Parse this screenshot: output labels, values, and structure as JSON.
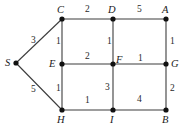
{
  "figure": {
    "kind": "weighted-undirected-graph",
    "width": 182,
    "height": 128,
    "background": "#ffffff",
    "edge_color": "#3d3d3d",
    "node_color": "#111111",
    "label_color": "#1a1a1a"
  },
  "nodes": [
    {
      "id": "S",
      "label": "S",
      "x": 16,
      "y": 63,
      "label_x": 5,
      "label_y": 58
    },
    {
      "id": "C",
      "label": "C",
      "x": 62,
      "y": 19,
      "label_x": 57,
      "label_y": 5
    },
    {
      "id": "D",
      "label": "D",
      "x": 113,
      "y": 19,
      "label_x": 108,
      "label_y": 5
    },
    {
      "id": "A",
      "label": "A",
      "x": 166,
      "y": 19,
      "label_x": 162,
      "label_y": 5
    },
    {
      "id": "E",
      "label": "E",
      "x": 62,
      "y": 64,
      "label_x": 49,
      "label_y": 59
    },
    {
      "id": "F",
      "label": "F",
      "x": 113,
      "y": 64,
      "label_x": 116,
      "label_y": 55
    },
    {
      "id": "G",
      "label": "G",
      "x": 166,
      "y": 64,
      "label_x": 171,
      "label_y": 59
    },
    {
      "id": "H",
      "label": "H",
      "x": 62,
      "y": 110,
      "label_x": 57,
      "label_y": 115
    },
    {
      "id": "I",
      "label": "I",
      "x": 113,
      "y": 110,
      "label_x": 110,
      "label_y": 115
    },
    {
      "id": "B",
      "label": "B",
      "x": 166,
      "y": 110,
      "label_x": 162,
      "label_y": 115
    }
  ],
  "edges": [
    {
      "from": "S",
      "to": "C",
      "weight": "3",
      "label_x": 31,
      "label_y": 36
    },
    {
      "from": "S",
      "to": "H",
      "weight": "5",
      "label_x": 31,
      "label_y": 85
    },
    {
      "from": "C",
      "to": "D",
      "weight": "2",
      "label_x": 85,
      "label_y": 5
    },
    {
      "from": "D",
      "to": "A",
      "weight": "5",
      "label_x": 137,
      "label_y": 5
    },
    {
      "from": "C",
      "to": "E",
      "weight": "1",
      "label_x": 56,
      "label_y": 37
    },
    {
      "from": "D",
      "to": "F",
      "weight": "1",
      "label_x": 107,
      "label_y": 37
    },
    {
      "from": "A",
      "to": "G",
      "weight": "1",
      "label_x": 170,
      "label_y": 37
    },
    {
      "from": "E",
      "to": "F",
      "weight": "2",
      "label_x": 85,
      "label_y": 52
    },
    {
      "from": "F",
      "to": "G",
      "weight": "1",
      "label_x": 138,
      "label_y": 54
    },
    {
      "from": "E",
      "to": "H",
      "weight": "1",
      "label_x": 56,
      "label_y": 84
    },
    {
      "from": "F",
      "to": "I",
      "weight": "3",
      "label_x": 105,
      "label_y": 83
    },
    {
      "from": "G",
      "to": "B",
      "weight": "2",
      "label_x": 170,
      "label_y": 84
    },
    {
      "from": "H",
      "to": "I",
      "weight": "1",
      "label_x": 85,
      "label_y": 96
    },
    {
      "from": "I",
      "to": "B",
      "weight": "4",
      "label_x": 137,
      "label_y": 95
    }
  ],
  "chart_data": {
    "type": "diagram",
    "title": "",
    "graph_type": "weighted undirected graph",
    "vertices": [
      "S",
      "A",
      "B",
      "C",
      "D",
      "E",
      "F",
      "G",
      "H",
      "I"
    ],
    "edge_list": [
      [
        "S",
        "C",
        3
      ],
      [
        "S",
        "H",
        5
      ],
      [
        "C",
        "D",
        2
      ],
      [
        "D",
        "A",
        5
      ],
      [
        "C",
        "E",
        1
      ],
      [
        "D",
        "F",
        1
      ],
      [
        "A",
        "G",
        1
      ],
      [
        "E",
        "F",
        2
      ],
      [
        "F",
        "G",
        1
      ],
      [
        "E",
        "H",
        1
      ],
      [
        "F",
        "I",
        3
      ],
      [
        "G",
        "B",
        2
      ],
      [
        "H",
        "I",
        1
      ],
      [
        "I",
        "B",
        4
      ]
    ]
  }
}
